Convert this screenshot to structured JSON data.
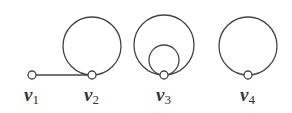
{
  "diagram": {
    "type": "graph",
    "stroke_color": "#444444",
    "background": "#ffffff",
    "vertices": [
      {
        "id": "v1",
        "letter": "v",
        "subscript": "1",
        "x": 32,
        "y": 75
      },
      {
        "id": "v2",
        "letter": "v",
        "subscript": "2",
        "x": 92,
        "y": 75
      },
      {
        "id": "v3",
        "letter": "v",
        "subscript": "3",
        "x": 164,
        "y": 75
      },
      {
        "id": "v4",
        "letter": "v",
        "subscript": "4",
        "x": 248,
        "y": 75
      }
    ],
    "edges": [
      {
        "from": "v1",
        "to": "v2",
        "type": "line"
      },
      {
        "from": "v2",
        "to": "v2",
        "type": "loop",
        "radius": 29
      },
      {
        "from": "v3",
        "to": "v3",
        "type": "loop",
        "radius": 30
      },
      {
        "from": "v3",
        "to": "v3",
        "type": "loop",
        "radius": 15
      },
      {
        "from": "v4",
        "to": "v4",
        "type": "loop",
        "radius": 29
      }
    ]
  }
}
